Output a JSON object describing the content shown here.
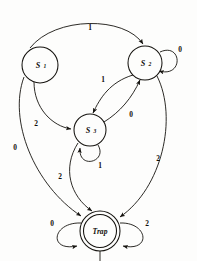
{
  "diagram": {
    "type": "finite-state-automaton",
    "alphabet": [
      "0",
      "1",
      "2"
    ],
    "stroke_color": "#15130f",
    "background_color": "#fdfdfc",
    "states": [
      {
        "id": "S1",
        "name": "S",
        "subscript": "1",
        "label": "S1",
        "accepting": false,
        "cx": 40,
        "cy": 65,
        "r": 18
      },
      {
        "id": "S2",
        "name": "S",
        "subscript": "2",
        "label": "S2",
        "accepting": false,
        "cx": 145,
        "cy": 63,
        "r": 17
      },
      {
        "id": "S3",
        "name": "S",
        "subscript": "3",
        "label": "S3",
        "accepting": false,
        "cx": 90,
        "cy": 130,
        "r": 16
      },
      {
        "id": "Trap",
        "name": "Trap",
        "subscript": "",
        "label": "Trap",
        "accepting": true,
        "cx": 100,
        "cy": 231,
        "r": 20
      }
    ],
    "transitions": [
      {
        "id": "t1",
        "from": "S1",
        "to": "S2",
        "symbol": "1",
        "label_x": 90,
        "label_y": 27
      },
      {
        "id": "t2",
        "from": "S1",
        "to": "S3",
        "symbol": "2",
        "label_x": 36,
        "label_y": 123
      },
      {
        "id": "t3",
        "from": "S1",
        "to": "Trap",
        "symbol": "0",
        "label_x": 15,
        "label_y": 147
      },
      {
        "id": "t4",
        "from": "S2",
        "to": "S2",
        "symbol": "0",
        "label_x": 180,
        "label_y": 49,
        "self_loop": true
      },
      {
        "id": "t5",
        "from": "S2",
        "to": "S3",
        "symbol": "1",
        "label_x": 103,
        "label_y": 79
      },
      {
        "id": "t6",
        "from": "S3",
        "to": "S2",
        "symbol": "0",
        "label_x": 131,
        "label_y": 114
      },
      {
        "id": "t7",
        "from": "S2",
        "to": "Trap",
        "symbol": "2",
        "label_x": 158,
        "label_y": 158
      },
      {
        "id": "t8",
        "from": "S3",
        "to": "S3",
        "symbol": "1",
        "label_x": 100,
        "label_y": 165,
        "self_loop": true
      },
      {
        "id": "t9",
        "from": "S3",
        "to": "Trap",
        "symbol": "2",
        "label_x": 60,
        "label_y": 176
      },
      {
        "id": "t10",
        "from": "Trap",
        "to": "Trap",
        "symbol": "0",
        "label_x": 52,
        "label_y": 223,
        "self_loop": true
      },
      {
        "id": "t11",
        "from": "Trap",
        "to": "Trap",
        "symbol": "2",
        "label_x": 147,
        "label_y": 223,
        "self_loop": true
      },
      {
        "id": "t12",
        "from": "Trap",
        "to": "Trap",
        "symbol": "1",
        "label_x": 100,
        "label_y": 260,
        "self_loop": true
      }
    ]
  }
}
